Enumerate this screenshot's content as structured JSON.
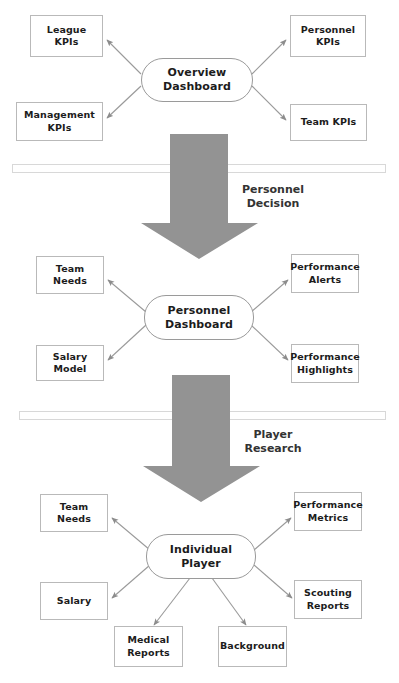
{
  "diagram": {
    "background_color": "#ffffff",
    "node_border_color": "#b9b9b9",
    "arrow_color": "#8c8c8c",
    "block_arrow_color": "#939393",
    "text_color": "#1c1c1c"
  },
  "levels": [
    {
      "id": "overview",
      "hub": {
        "label": "Overview\nDashboard"
      },
      "leaves": [
        {
          "label": "League\nKPIs"
        },
        {
          "label": "Personnel\nKPIs"
        },
        {
          "label": "Management\nKPIs"
        },
        {
          "label": "Team KPIs"
        }
      ]
    },
    {
      "id": "personnel",
      "hub": {
        "label": "Personnel\nDashboard"
      },
      "leaves": [
        {
          "label": "Team Needs"
        },
        {
          "label": "Performance\nAlerts"
        },
        {
          "label": "Salary Model"
        },
        {
          "label": "Performance\nHighlights"
        }
      ]
    },
    {
      "id": "player",
      "hub": {
        "label": "Individual\nPlayer"
      },
      "leaves": [
        {
          "label": "Team Needs"
        },
        {
          "label": "Performance\nMetrics"
        },
        {
          "label": "Salary"
        },
        {
          "label": "Scouting\nReports"
        },
        {
          "label": "Medical\nReports"
        },
        {
          "label": "Background"
        }
      ]
    }
  ],
  "nodes": {
    "league_kpis": {
      "line1": "League",
      "line2": "KPIs"
    },
    "personnel_kpis": {
      "line1": "Personnel",
      "line2": "KPIs"
    },
    "management_kpis": {
      "line1": "Management",
      "line2": "KPIs"
    },
    "team_kpis": {
      "line1": "Team KPIs",
      "line2": ""
    },
    "overview_dashboard": {
      "line1": "Overview",
      "line2": "Dashboard"
    },
    "team_needs_mid": {
      "line1": "Team Needs",
      "line2": ""
    },
    "performance_alerts": {
      "line1": "Performance",
      "line2": "Alerts"
    },
    "salary_model": {
      "line1": "Salary Model",
      "line2": ""
    },
    "performance_highlights": {
      "line1": "Performance",
      "line2": "Highlights"
    },
    "personnel_dashboard": {
      "line1": "Personnel",
      "line2": "Dashboard"
    },
    "team_needs_bottom": {
      "line1": "Team Needs",
      "line2": ""
    },
    "performance_metrics": {
      "line1": "Performance",
      "line2": "Metrics"
    },
    "salary": {
      "line1": "Salary",
      "line2": ""
    },
    "scouting_reports": {
      "line1": "Scouting",
      "line2": "Reports"
    },
    "medical_reports": {
      "line1": "Medical",
      "line2": "Reports"
    },
    "background": {
      "line1": "Background",
      "line2": ""
    },
    "individual_player": {
      "line1": "Individual",
      "line2": "Player"
    }
  },
  "transitions": [
    {
      "id": "personnel_decision",
      "line1": "Personnel",
      "line2": "Decision"
    },
    {
      "id": "player_research",
      "line1": "Player",
      "line2": "Research"
    }
  ]
}
